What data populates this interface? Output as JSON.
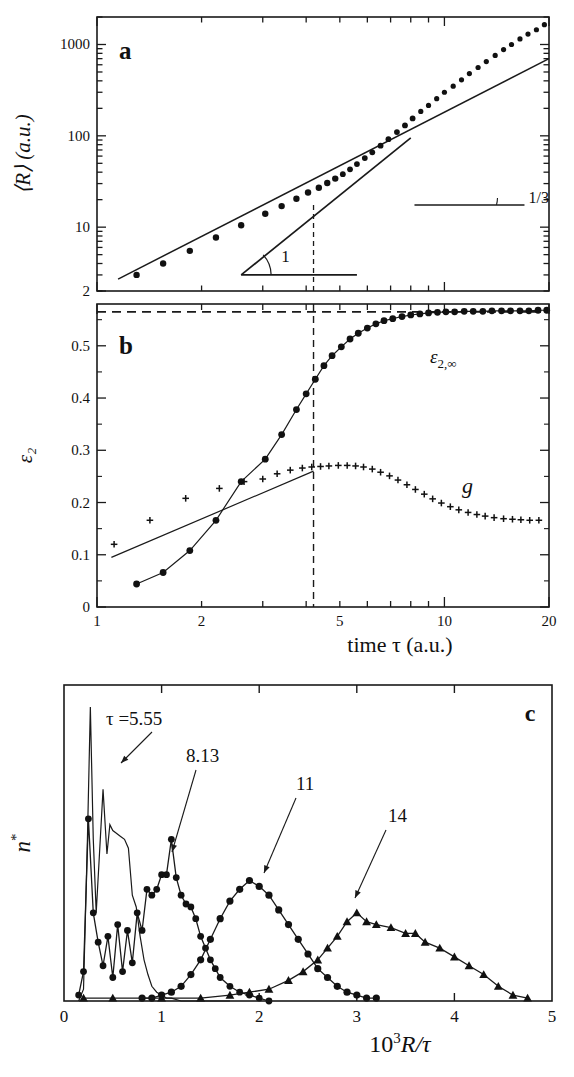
{
  "figure": {
    "panels": [
      "a",
      "b",
      "c"
    ],
    "panel_a_label": "a",
    "panel_b_label": "b",
    "panel_c_label": "c"
  },
  "panel_a": {
    "label": "a",
    "ylabel": "⟨R⟩ (a.u.)",
    "ytick_labels": [
      "2",
      "10",
      "100",
      "1000"
    ],
    "xtick_labels": [
      "1",
      "2",
      "5",
      "10",
      "20"
    ],
    "slope_label_1": "1",
    "slope_label_2": "1/3"
  },
  "panel_b": {
    "label": "b",
    "ylabel": "ε₂",
    "ytick_labels": [
      "0",
      "0.1",
      "0.2",
      "0.3",
      "0.4",
      "0.5"
    ],
    "xtick_labels": [
      "1",
      "2",
      "5",
      "10",
      "20"
    ],
    "xlabel": "time τ (a.u.)",
    "annotation_eps": "ε",
    "annotation_eps_sub": "2,∞",
    "annotation_g": "g"
  },
  "panel_c": {
    "label": "c",
    "ylabel": "n",
    "ylabel_star": "*",
    "xtick_labels": [
      "0",
      "1",
      "2",
      "3",
      "4",
      "5"
    ],
    "xlabel_prefix": "10",
    "xlabel_exp": "3",
    "xlabel_suffix": "R/τ",
    "curve_labels": [
      "τ =5.55",
      "8.13",
      "11",
      "14"
    ]
  },
  "chart_data": [
    {
      "type": "scatter",
      "panel": "a",
      "title": "",
      "xlabel": "time τ (a.u.)",
      "ylabel": "⟨R⟩ (a.u.)",
      "xscale": "log",
      "yscale": "log",
      "xlim": [
        1,
        20
      ],
      "ylim": [
        2,
        2000
      ],
      "xticks": [
        1,
        2,
        5,
        10,
        20
      ],
      "yticks": [
        2,
        10,
        100,
        1000
      ],
      "grid": false,
      "series": [
        {
          "name": "⟨R⟩ data",
          "marker": "filled-circle",
          "x": [
            1.3,
            1.55,
            1.85,
            2.2,
            2.6,
            3.05,
            3.4,
            3.75,
            4.05,
            4.35,
            4.6,
            4.85,
            5.1,
            5.35,
            5.6,
            5.9,
            6.2,
            6.55,
            6.9,
            7.3,
            7.7,
            8.1,
            8.55,
            9.0,
            9.5,
            10.0,
            10.6,
            11.2,
            11.8,
            12.5,
            13.2,
            14.0,
            14.8,
            15.6,
            16.5,
            17.4,
            18.4,
            19.4
          ],
          "y": [
            3.0,
            4.0,
            5.5,
            7.7,
            10.5,
            14.0,
            17.0,
            20.5,
            24.0,
            27.0,
            30.5,
            34.0,
            38.0,
            43.0,
            49.0,
            57.0,
            66.0,
            78.0,
            92.0,
            110.0,
            130.0,
            155.0,
            185.0,
            215.0,
            255.0,
            300.0,
            350.0,
            410.0,
            480.0,
            560.0,
            650.0,
            760.0,
            880.0,
            1000.0,
            1150.0,
            1300.0,
            1450.0,
            1650.0
          ]
        },
        {
          "name": "slope 1/3 guide line",
          "type": "line",
          "slope": 0.3333,
          "x": [
            1.15,
            20.0
          ],
          "y": [
            2.7,
            700.0
          ]
        },
        {
          "name": "slope 1 guide line",
          "type": "line",
          "slope": 1.0,
          "x": [
            2.6,
            8.0
          ],
          "y": [
            3.0,
            95.0
          ]
        }
      ],
      "annotations": [
        {
          "text": "1",
          "meaning": "slope exponent 1"
        },
        {
          "text": "1/3",
          "meaning": "slope exponent 1/3"
        },
        {
          "text": "a",
          "meaning": "panel label"
        }
      ],
      "vline": 4.2
    },
    {
      "type": "scatter",
      "panel": "b",
      "title": "",
      "xlabel": "time τ (a.u.)",
      "ylabel": "ε₂",
      "xscale": "log",
      "yscale": "linear",
      "xlim": [
        1,
        20
      ],
      "ylim": [
        0,
        0.58
      ],
      "xticks": [
        1,
        2,
        5,
        10,
        20
      ],
      "yticks": [
        0,
        0.1,
        0.2,
        0.3,
        0.4,
        0.5
      ],
      "grid": false,
      "hline": 0.565,
      "vline": 4.2,
      "series": [
        {
          "name": "ε₂",
          "marker": "filled-circle",
          "x": [
            1.3,
            1.55,
            1.85,
            2.2,
            2.6,
            3.05,
            3.4,
            3.75,
            4.0,
            4.25,
            4.5,
            4.75,
            5.05,
            5.35,
            5.65,
            6.0,
            6.35,
            6.7,
            7.1,
            7.55,
            8.0,
            8.5,
            9.0,
            9.55,
            10.1,
            10.7,
            11.4,
            12.1,
            12.9,
            13.7,
            14.6,
            15.5,
            16.5,
            17.5,
            18.6,
            19.7
          ],
          "y": [
            0.044,
            0.066,
            0.108,
            0.166,
            0.24,
            0.283,
            0.33,
            0.378,
            0.408,
            0.436,
            0.462,
            0.481,
            0.498,
            0.513,
            0.524,
            0.534,
            0.542,
            0.548,
            0.552,
            0.556,
            0.559,
            0.561,
            0.563,
            0.564,
            0.565,
            0.565,
            0.566,
            0.566,
            0.566,
            0.567,
            0.567,
            0.567,
            0.567,
            0.567,
            0.568,
            0.568
          ]
        },
        {
          "name": "g",
          "marker": "plus",
          "x": [
            1.12,
            1.42,
            1.8,
            2.25,
            2.65,
            3.0,
            3.3,
            3.6,
            3.9,
            4.15,
            4.4,
            4.65,
            4.95,
            5.25,
            5.55,
            5.85,
            6.2,
            6.55,
            6.95,
            7.35,
            7.8,
            8.25,
            8.75,
            9.25,
            9.8,
            10.4,
            11.0,
            11.7,
            12.4,
            13.1,
            13.9,
            14.8,
            15.7,
            16.6,
            17.6,
            18.7
          ],
          "y": [
            0.12,
            0.166,
            0.208,
            0.227,
            0.24,
            0.245,
            0.255,
            0.262,
            0.266,
            0.268,
            0.269,
            0.27,
            0.271,
            0.271,
            0.27,
            0.268,
            0.264,
            0.258,
            0.251,
            0.243,
            0.234,
            0.225,
            0.216,
            0.207,
            0.199,
            0.192,
            0.186,
            0.181,
            0.177,
            0.174,
            0.171,
            0.169,
            0.168,
            0.167,
            0.166,
            0.166
          ]
        },
        {
          "name": "g fit line",
          "type": "line",
          "x": [
            1.1,
            4.2
          ],
          "y": [
            0.095,
            0.26
          ]
        }
      ],
      "annotations": [
        {
          "text": "ε₂,∞",
          "meaning": "asymptotic epsilon 2"
        },
        {
          "text": "g",
          "meaning": "g curve label"
        },
        {
          "text": "b",
          "meaning": "panel label"
        }
      ]
    },
    {
      "type": "line",
      "panel": "c",
      "title": "",
      "xlabel": "10³R/τ",
      "ylabel": "n*",
      "xscale": "linear",
      "yscale": "linear",
      "xlim": [
        0,
        5
      ],
      "ylim": [
        0,
        1
      ],
      "xticks": [
        0,
        1,
        2,
        3,
        4,
        5
      ],
      "yticks": [],
      "grid": false,
      "series": [
        {
          "name": "τ =5.55",
          "marker": "none",
          "x": [
            0.15,
            0.2,
            0.24,
            0.27,
            0.3,
            0.33,
            0.36,
            0.4,
            0.44,
            0.47,
            0.5,
            0.54,
            0.58,
            0.62,
            0.66,
            0.7,
            0.74,
            0.78,
            0.82,
            0.86,
            0.9,
            0.95,
            1.0,
            1.05,
            1.1,
            1.2,
            1.4,
            1.7
          ],
          "y": [
            0.0,
            0.04,
            0.55,
            1.0,
            0.55,
            0.3,
            0.48,
            0.72,
            0.5,
            0.6,
            0.58,
            0.57,
            0.56,
            0.55,
            0.52,
            0.36,
            0.32,
            0.22,
            0.14,
            0.09,
            0.05,
            0.03,
            0.02,
            0.01,
            0.01,
            0.0,
            0.0,
            0.0
          ]
        },
        {
          "name": "8.13",
          "marker": "filled-circle",
          "x": [
            0.15,
            0.2,
            0.25,
            0.3,
            0.35,
            0.4,
            0.45,
            0.5,
            0.55,
            0.6,
            0.65,
            0.7,
            0.75,
            0.8,
            0.85,
            0.9,
            0.95,
            1.0,
            1.05,
            1.1,
            1.15,
            1.2,
            1.25,
            1.3,
            1.35,
            1.4,
            1.45,
            1.5,
            1.55,
            1.6,
            1.7,
            1.8,
            1.9,
            2.0,
            2.1
          ],
          "y": [
            0.02,
            0.1,
            0.62,
            0.3,
            0.2,
            0.12,
            0.22,
            0.08,
            0.26,
            0.1,
            0.24,
            0.13,
            0.3,
            0.24,
            0.38,
            0.36,
            0.38,
            0.43,
            0.43,
            0.55,
            0.42,
            0.36,
            0.33,
            0.32,
            0.28,
            0.22,
            0.18,
            0.14,
            0.11,
            0.08,
            0.05,
            0.03,
            0.02,
            0.01,
            0.0
          ]
        },
        {
          "name": "11",
          "marker": "filled-circle",
          "x": [
            0.8,
            0.9,
            1.0,
            1.1,
            1.2,
            1.3,
            1.4,
            1.5,
            1.6,
            1.7,
            1.8,
            1.9,
            2.0,
            2.1,
            2.2,
            2.3,
            2.4,
            2.5,
            2.6,
            2.7,
            2.8,
            2.9,
            3.0,
            3.1,
            3.2
          ],
          "y": [
            0.01,
            0.01,
            0.02,
            0.03,
            0.05,
            0.09,
            0.14,
            0.21,
            0.28,
            0.34,
            0.38,
            0.41,
            0.39,
            0.36,
            0.31,
            0.26,
            0.21,
            0.16,
            0.11,
            0.08,
            0.05,
            0.03,
            0.02,
            0.01,
            0.01
          ]
        },
        {
          "name": "14",
          "marker": "filled-triangle",
          "x": [
            0.2,
            0.5,
            1.0,
            1.4,
            1.7,
            1.9,
            2.1,
            2.3,
            2.45,
            2.6,
            2.7,
            2.8,
            2.9,
            3.0,
            3.1,
            3.2,
            3.35,
            3.5,
            3.6,
            3.7,
            3.85,
            4.0,
            4.15,
            4.3,
            4.45,
            4.6,
            4.75
          ],
          "y": [
            0.01,
            0.01,
            0.01,
            0.01,
            0.02,
            0.03,
            0.04,
            0.07,
            0.1,
            0.14,
            0.18,
            0.22,
            0.27,
            0.3,
            0.27,
            0.26,
            0.25,
            0.23,
            0.23,
            0.2,
            0.18,
            0.15,
            0.12,
            0.09,
            0.05,
            0.02,
            0.01
          ]
        }
      ],
      "annotations": [
        {
          "text": "τ =5.55",
          "meaning": "curve label tau 5.55"
        },
        {
          "text": "8.13",
          "meaning": "curve label tau 8.13"
        },
        {
          "text": "11",
          "meaning": "curve label tau 11"
        },
        {
          "text": "14",
          "meaning": "curve label tau 14"
        },
        {
          "text": "c",
          "meaning": "panel label"
        }
      ]
    }
  ]
}
